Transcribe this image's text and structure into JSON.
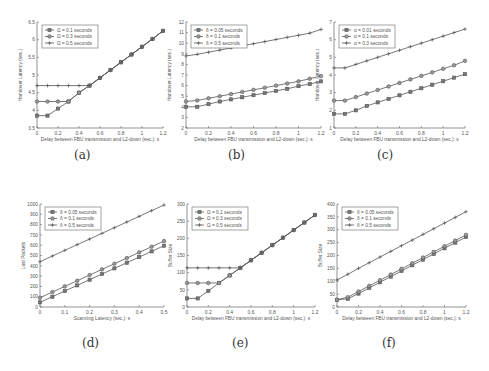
{
  "captions": [
    "(a)",
    "(b)",
    "(c)",
    "(d)",
    "(e)",
    "(f)"
  ],
  "chart_data": [
    {
      "id": "a",
      "type": "line",
      "title": "",
      "xlabel": "Delay between FBU transmission and L2-down (sec.): s",
      "ylabel": "Handover Latency (sec.)",
      "xlim": [
        0,
        1.2
      ],
      "ylim": [
        3.5,
        6.5
      ],
      "xticks": [
        0,
        0.2,
        0.4,
        0.6,
        0.8,
        1,
        1.2
      ],
      "yticks": [
        3.5,
        4,
        4.5,
        5,
        5.5,
        6,
        6.5
      ],
      "legend_position": "upper left",
      "grid": false,
      "x": [
        0,
        0.1,
        0.2,
        0.3,
        0.4,
        0.5,
        0.6,
        0.7,
        0.8,
        0.9,
        1.0,
        1.1,
        1.2
      ],
      "series": [
        {
          "name": "Ω = 0.1 seconds",
          "marker": "square",
          "values": [
            3.85,
            3.85,
            4.05,
            4.25,
            4.5,
            4.7,
            4.92,
            5.14,
            5.36,
            5.58,
            5.8,
            6.02,
            6.25
          ]
        },
        {
          "name": "Ω = 0.3 seconds",
          "marker": "circle",
          "values": [
            4.25,
            4.25,
            4.25,
            4.25,
            4.5,
            4.7,
            4.92,
            5.14,
            5.36,
            5.58,
            5.8,
            6.02,
            6.25
          ]
        },
        {
          "name": "Ω = 0.5 seconds",
          "marker": "plus",
          "values": [
            4.7,
            4.7,
            4.7,
            4.7,
            4.7,
            4.7,
            4.92,
            5.14,
            5.36,
            5.58,
            5.8,
            6.02,
            6.25
          ]
        }
      ]
    },
    {
      "id": "b",
      "type": "line",
      "title": "",
      "xlabel": "Delay between FBU transmission and L2-down (sec.): s",
      "ylabel": "Handover Latency (sec.)",
      "xlim": [
        0,
        1.2
      ],
      "ylim": [
        2,
        12
      ],
      "xticks": [
        0,
        0.2,
        0.4,
        0.6,
        0.8,
        1,
        1.2
      ],
      "yticks": [
        2,
        3,
        4,
        5,
        6,
        7,
        8,
        9,
        10,
        11,
        12
      ],
      "legend_position": "upper left",
      "grid": false,
      "x": [
        0,
        0.1,
        0.2,
        0.3,
        0.4,
        0.5,
        0.6,
        0.7,
        0.8,
        0.9,
        1.0,
        1.1,
        1.2
      ],
      "series": [
        {
          "name": "δ = 0.05 seconds",
          "marker": "square",
          "values": [
            4.0,
            4.0,
            4.25,
            4.5,
            4.7,
            4.9,
            5.1,
            5.3,
            5.5,
            5.7,
            5.95,
            6.15,
            6.4
          ]
        },
        {
          "name": "δ = 0.1 seconds",
          "marker": "circle",
          "values": [
            4.5,
            4.6,
            4.8,
            5.0,
            5.2,
            5.4,
            5.6,
            5.8,
            6.0,
            6.2,
            6.4,
            6.65,
            6.9
          ]
        },
        {
          "name": "δ = 0.5 seconds",
          "marker": "plus",
          "values": [
            8.8,
            8.95,
            9.15,
            9.35,
            9.55,
            9.75,
            9.95,
            10.15,
            10.35,
            10.55,
            10.75,
            10.95,
            11.3
          ]
        }
      ]
    },
    {
      "id": "c",
      "type": "line",
      "title": "",
      "xlabel": "Delay between FBU transmission and L2-down (sec.): s",
      "ylabel": "Handover Latency (sec.)",
      "xlim": [
        0,
        1.2
      ],
      "ylim": [
        1,
        7
      ],
      "xticks": [
        0,
        0.2,
        0.4,
        0.6,
        0.8,
        1,
        1.2
      ],
      "yticks": [
        1,
        2,
        3,
        4,
        5,
        6,
        7
      ],
      "legend_position": "upper left",
      "grid": false,
      "x": [
        0,
        0.1,
        0.2,
        0.3,
        0.4,
        0.5,
        0.6,
        0.7,
        0.8,
        0.9,
        1.0,
        1.1,
        1.2
      ],
      "series": [
        {
          "name": "α = 0.01 seconds",
          "marker": "square",
          "values": [
            1.8,
            1.8,
            2.0,
            2.25,
            2.45,
            2.65,
            2.85,
            3.05,
            3.25,
            3.45,
            3.65,
            3.85,
            4.05
          ]
        },
        {
          "name": "α = 0.1 seconds",
          "marker": "circle",
          "values": [
            2.55,
            2.55,
            2.75,
            2.95,
            3.15,
            3.35,
            3.55,
            3.75,
            3.95,
            4.15,
            4.35,
            4.55,
            4.8
          ]
        },
        {
          "name": "α = 0.3 seconds",
          "marker": "plus",
          "values": [
            4.4,
            4.4,
            4.6,
            4.8,
            5.0,
            5.2,
            5.4,
            5.6,
            5.8,
            6.0,
            6.2,
            6.4,
            6.6
          ]
        }
      ]
    },
    {
      "id": "d",
      "type": "line",
      "title": "",
      "xlabel": "Scanning Latency (sec.): s",
      "ylabel": "Lost Packets",
      "xlim": [
        0,
        0.5
      ],
      "ylim": [
        0,
        1000
      ],
      "xticks": [
        0,
        0.1,
        0.2,
        0.3,
        0.4,
        0.5
      ],
      "yticks": [
        0,
        100,
        200,
        300,
        400,
        500,
        600,
        700,
        800,
        900,
        1000
      ],
      "legend_position": "upper left",
      "grid": false,
      "x": [
        0,
        0.05,
        0.1,
        0.15,
        0.2,
        0.25,
        0.3,
        0.35,
        0.4,
        0.45,
        0.5
      ],
      "series": [
        {
          "name": "δ = 0.05 seconds",
          "marker": "square",
          "values": [
            45,
            100,
            155,
            210,
            265,
            320,
            375,
            430,
            485,
            540,
            595
          ]
        },
        {
          "name": "δ = 0.1 seconds",
          "marker": "circle",
          "values": [
            90,
            145,
            200,
            255,
            310,
            365,
            420,
            475,
            530,
            585,
            640
          ]
        },
        {
          "name": "δ = 0.5 seconds",
          "marker": "plus",
          "values": [
            440,
            495,
            550,
            605,
            660,
            715,
            770,
            825,
            880,
            935,
            990
          ]
        }
      ]
    },
    {
      "id": "e",
      "type": "line",
      "title": "",
      "xlabel": "Delay between FBU transmission and L2-down (sec.): s",
      "ylabel": "Buffer Size",
      "xlim": [
        0,
        1.2
      ],
      "ylim": [
        0,
        300
      ],
      "xticks": [
        0,
        0.2,
        0.4,
        0.6,
        0.8,
        1,
        1.2
      ],
      "yticks": [
        0,
        50,
        100,
        150,
        200,
        250,
        300
      ],
      "legend_position": "upper left",
      "grid": false,
      "x": [
        0,
        0.1,
        0.2,
        0.3,
        0.4,
        0.5,
        0.6,
        0.7,
        0.8,
        0.9,
        1.0,
        1.1,
        1.2
      ],
      "series": [
        {
          "name": "Ω = 0.1 seconds",
          "marker": "square",
          "values": [
            25,
            25,
            47,
            70,
            92,
            114,
            136,
            158,
            180,
            202,
            224,
            246,
            268
          ]
        },
        {
          "name": "Ω = 0.3 seconds",
          "marker": "circle",
          "values": [
            70,
            70,
            70,
            70,
            92,
            114,
            136,
            158,
            180,
            202,
            224,
            246,
            268
          ]
        },
        {
          "name": "Ω = 0.5 seconds",
          "marker": "plus",
          "values": [
            114,
            114,
            114,
            114,
            114,
            114,
            136,
            158,
            180,
            202,
            224,
            246,
            268
          ]
        }
      ]
    },
    {
      "id": "f",
      "type": "line",
      "title": "",
      "xlabel": "Delay between FBU transmission and L2-down (sec.): s",
      "ylabel": "Buffer Size",
      "xlim": [
        0,
        1.2
      ],
      "ylim": [
        0,
        400
      ],
      "xticks": [
        0,
        0.2,
        0.4,
        0.6,
        0.8,
        1,
        1.2
      ],
      "yticks": [
        0,
        50,
        100,
        150,
        200,
        250,
        300,
        350,
        400
      ],
      "legend_position": "upper left",
      "grid": false,
      "x": [
        0,
        0.1,
        0.2,
        0.3,
        0.4,
        0.5,
        0.6,
        0.7,
        0.8,
        0.9,
        1.0,
        1.1,
        1.2
      ],
      "series": [
        {
          "name": "δ = 0.05 seconds",
          "marker": "square",
          "values": [
            28,
            32,
            52,
            74,
            96,
            118,
            140,
            162,
            184,
            206,
            228,
            250,
            272
          ]
        },
        {
          "name": "δ = 0.1 seconds",
          "marker": "circle",
          "values": [
            28,
            38,
            60,
            82,
            104,
            126,
            148,
            170,
            192,
            214,
            236,
            258,
            280
          ]
        },
        {
          "name": "δ = 0.5 seconds",
          "marker": "plus",
          "values": [
            105,
            127,
            150,
            172,
            194,
            216,
            238,
            260,
            282,
            304,
            326,
            348,
            370
          ]
        }
      ]
    }
  ],
  "layout": {
    "panels": [
      {
        "left": 37,
        "top": 22,
        "width": 126,
        "height": 106,
        "caption_x": 82,
        "caption_y": 148
      },
      {
        "left": 186,
        "top": 22,
        "width": 135,
        "height": 106,
        "caption_x": 236,
        "caption_y": 148
      },
      {
        "left": 334,
        "top": 22,
        "width": 131,
        "height": 106,
        "caption_x": 385,
        "caption_y": 148
      },
      {
        "left": 40,
        "top": 204,
        "width": 124,
        "height": 103,
        "caption_x": 90,
        "caption_y": 336
      },
      {
        "left": 187,
        "top": 204,
        "width": 128,
        "height": 103,
        "caption_x": 240,
        "caption_y": 336
      },
      {
        "left": 337,
        "top": 204,
        "width": 129,
        "height": 103,
        "caption_x": 390,
        "caption_y": 336
      }
    ],
    "line_color": "#555555",
    "axis_color": "#666666"
  }
}
